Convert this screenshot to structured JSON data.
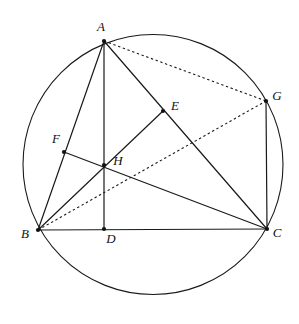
{
  "figure": {
    "canvas": {
      "width": 299,
      "height": 324
    },
    "stroke_color": "#1a1a1a",
    "label_color": "#111111",
    "background": "#ffffff"
  },
  "circle": {
    "name": "circumcircle",
    "cx": 153,
    "cy": 164.5,
    "r": 130,
    "style": "solid"
  },
  "points": [
    {
      "id": "A",
      "label": "A",
      "x": 104,
      "y": 41,
      "lx": 101,
      "ly": 28,
      "dot": true
    },
    {
      "id": "B",
      "label": "B",
      "x": 38,
      "y": 230,
      "lx": 25,
      "ly": 235,
      "dot": true
    },
    {
      "id": "C",
      "label": "C",
      "x": 267,
      "y": 229,
      "lx": 277,
      "ly": 234,
      "dot": true
    },
    {
      "id": "D",
      "label": "D",
      "x": 104,
      "y": 229,
      "lx": 111,
      "ly": 240,
      "dot": true
    },
    {
      "id": "E",
      "label": "E",
      "x": 163,
      "y": 111,
      "lx": 175,
      "ly": 107,
      "dot": true
    },
    {
      "id": "F",
      "label": "F",
      "x": 64,
      "y": 152,
      "lx": 56,
      "ly": 140,
      "dot": true
    },
    {
      "id": "G",
      "label": "G",
      "x": 266,
      "y": 101,
      "lx": 277,
      "ly": 97,
      "dot": true
    },
    {
      "id": "H",
      "label": "H",
      "x": 104,
      "y": 165,
      "lx": 118,
      "ly": 162,
      "dot": true
    }
  ],
  "segments": [
    {
      "id": "BC",
      "from": "B",
      "to": "C",
      "style": "solid"
    },
    {
      "id": "AB",
      "from": "A",
      "to": "B",
      "style": "solid"
    },
    {
      "id": "AC",
      "from": "A",
      "to": "C",
      "style": "solid"
    },
    {
      "id": "AD",
      "from": "A",
      "to": "D",
      "style": "solid"
    },
    {
      "id": "BE",
      "from": "B",
      "to": "E",
      "style": "solid"
    },
    {
      "id": "FC",
      "from": "F",
      "to": "C",
      "style": "solid"
    },
    {
      "id": "GC",
      "from": "G",
      "to": "C",
      "style": "solid"
    },
    {
      "id": "AG",
      "from": "A",
      "to": "G",
      "style": "dashed"
    },
    {
      "id": "BG",
      "from": "B",
      "to": "G",
      "style": "dashed"
    }
  ],
  "labels": {
    "A": "A",
    "B": "B",
    "C": "C",
    "D": "D",
    "E": "E",
    "F": "F",
    "G": "G",
    "H": "H"
  }
}
